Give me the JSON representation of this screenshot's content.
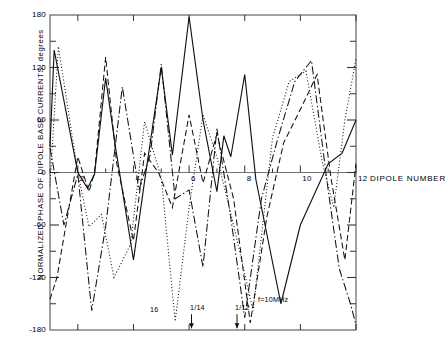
{
  "axes": {
    "ylabel": "NORMALIZED PHASE OF DIPOLE BASE CURRENTS, degrees",
    "xlabel": "DIPOLE NUMBER",
    "ytick_labels": [
      "180",
      "120",
      "60",
      "0",
      "-60",
      "-120",
      "-180"
    ],
    "xtick_labels": [
      "2",
      "4",
      "6",
      "8",
      "10",
      "12"
    ]
  },
  "annotations": {
    "f16": "16",
    "f14": "1/14",
    "f12": "1/12",
    "f10": "f=10MHz"
  },
  "chart_data": {
    "type": "line",
    "title": "",
    "xlabel": "DIPOLE NUMBER",
    "ylabel": "NORMALIZED PHASE OF DIPOLE BASE CURRENTS, degrees",
    "xlim": [
      1,
      12
    ],
    "ylim": [
      -180,
      180
    ],
    "ytick_values": [
      180,
      120,
      60,
      0,
      -60,
      -120,
      -180
    ],
    "xtick_values": [
      2,
      4,
      6,
      8,
      10,
      12
    ],
    "yminor_step": 30,
    "xminor_step": 1,
    "grid": false,
    "legend": "inline-annotations",
    "series": [
      {
        "name": "f=10MHz",
        "style": "solid",
        "x": [
          1.0,
          1.15,
          2.0,
          2.35,
          2.6,
          3.0,
          3.35,
          4.0,
          4.4,
          5.0,
          5.4,
          6.0,
          6.5,
          7.0,
          7.25,
          7.5,
          8.0,
          8.4,
          9.3,
          10.0,
          11.0,
          11.5,
          12.0
        ],
        "y": [
          30,
          140,
          0,
          -18,
          -2,
          108,
          30,
          -100,
          -10,
          120,
          20,
          178,
          60,
          -22,
          42,
          18,
          112,
          -8,
          -150,
          -60,
          10,
          22,
          60
        ]
      },
      {
        "name": "16",
        "style": "dotted",
        "x": [
          1.0,
          1.3,
          2.0,
          2.4,
          2.85,
          3.3,
          3.9,
          4.4,
          5.0,
          5.5,
          6.0,
          6.5,
          7.0,
          7.6,
          8.3,
          9.0,
          9.6,
          10.2,
          10.8,
          11.2,
          11.6,
          12.0
        ],
        "y": [
          -15,
          144,
          0,
          -62,
          -48,
          -120,
          -82,
          58,
          -6,
          -170,
          -40,
          66,
          18,
          -60,
          -158,
          40,
          104,
          116,
          10,
          -40,
          60,
          130
        ]
      },
      {
        "name": "1/14",
        "style": "dashed",
        "x": [
          1.0,
          1.25,
          1.6,
          2.0,
          2.4,
          2.6,
          3.0,
          3.4,
          4.0,
          4.4,
          4.9,
          5.4,
          6.0,
          6.5,
          7.0,
          7.6,
          8.2,
          8.8,
          9.4,
          10.0,
          10.6,
          11.1,
          11.6,
          12.0
        ],
        "y": [
          -145,
          -120,
          -55,
          18,
          -22,
          0,
          132,
          10,
          -78,
          22,
          0,
          -40,
          66,
          -12,
          44,
          -30,
          -172,
          -50,
          34,
          72,
          112,
          -6,
          -100,
          10
        ]
      },
      {
        "name": "1/12",
        "style": "dashdot",
        "x": [
          1.0,
          1.5,
          2.0,
          2.5,
          3.0,
          3.6,
          4.2,
          4.6,
          5.0,
          5.5,
          6.0,
          6.5,
          7.0,
          7.5,
          8.0,
          8.6,
          9.2,
          9.8,
          10.4,
          11.0,
          11.4,
          11.8,
          12.0
        ],
        "y": [
          28,
          -60,
          -2,
          -158,
          -62,
          98,
          -20,
          20,
          124,
          -30,
          -20,
          -108,
          50,
          -52,
          -166,
          -30,
          40,
          104,
          128,
          -20,
          -110,
          -150,
          -174
        ]
      }
    ]
  }
}
